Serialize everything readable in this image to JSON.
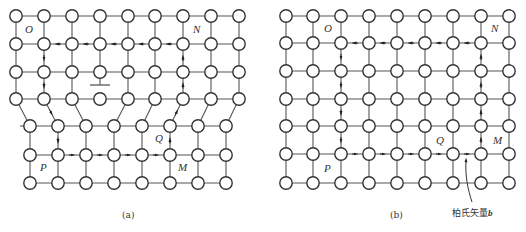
{
  "figure_a": {
    "caption": "(a)",
    "labels": {
      "O": "O",
      "N": "N",
      "P": "P",
      "Q": "Q",
      "M": "M"
    },
    "description": "Lattice with edge dislocation and Burgers circuit (closed)",
    "dislocation_symbol": "⊥"
  },
  "figure_b": {
    "caption": "(b)",
    "labels": {
      "O": "O",
      "N": "N",
      "P": "P",
      "Q": "Q",
      "M": "M"
    },
    "burgers_vector_label": "柏氏矢量",
    "burgers_vector_symbol": "b",
    "description": "Perfect lattice with Burgers circuit (open, closure failure = b)"
  },
  "colors": {
    "line": "#555555",
    "atom_stroke": "#333333",
    "atom_fill": "#ffffff",
    "arrow": "#222222"
  }
}
